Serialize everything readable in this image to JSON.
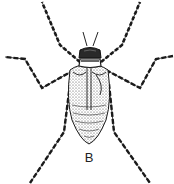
{
  "figure": {
    "label": "B",
    "colors": {
      "ink": "#1a1a1a",
      "paper": "#ffffff",
      "stipple": "#555555"
    }
  }
}
